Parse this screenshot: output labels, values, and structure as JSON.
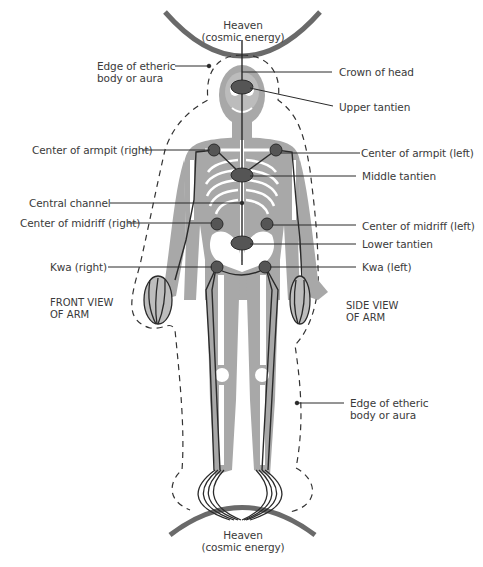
{
  "diagram": {
    "type": "anatomical-energy-diagram",
    "colors": {
      "body_fill": "#a8a8a8",
      "bone_fill": "#ffffff",
      "line": "#2a2a2a",
      "arc": "#6a6a6a",
      "tantien_fill": "#555555",
      "text": "#3a3a3a"
    },
    "top_label": {
      "line1": "Heaven",
      "line2": "(cosmic energy)"
    },
    "bottom_label": {
      "line1": "Heaven",
      "line2": "(cosmic energy)"
    },
    "left_labels": {
      "aura_top": {
        "line1": "Edge of etheric",
        "line2": "body or aura"
      },
      "armpit_right": "Center of armpit (right)",
      "central_channel": "Central channel",
      "midriff_right": "Center of midriff (right)",
      "kwa_right": "Kwa (right)",
      "front_view_arm": {
        "line1": "FRONT VIEW",
        "line2": "OF ARM"
      }
    },
    "right_labels": {
      "crown": "Crown of head",
      "upper_tantien": "Upper tantien",
      "armpit_left": "Center of armpit (left)",
      "middle_tantien": "Middle tantien",
      "midriff_left": "Center of midriff (left)",
      "lower_tantien": "Lower tantien",
      "kwa_left": "Kwa (left)",
      "side_view_arm": {
        "line1": "SIDE VIEW",
        "line2": "OF ARM"
      },
      "aura_bottom": {
        "line1": "Edge of etheric",
        "line2": "body or aura"
      }
    }
  }
}
